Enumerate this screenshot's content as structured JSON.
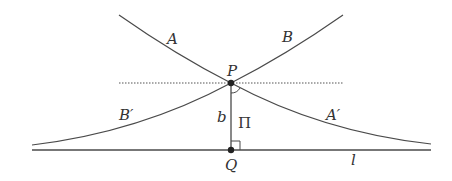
{
  "diagram": {
    "colors": {
      "stroke": "#4a4a4a",
      "text": "#333333",
      "background": "#ffffff"
    },
    "points": {
      "P": {
        "label": "P",
        "x": 231,
        "y": 83
      },
      "Q": {
        "label": "Q",
        "x": 231,
        "y": 150
      }
    },
    "lines": {
      "l": {
        "label": "l",
        "x1": 32,
        "x2": 431,
        "y": 150
      },
      "dotted": {
        "x1": 119,
        "x2": 343,
        "y": 83
      },
      "perpendicular": {
        "label": "b"
      }
    },
    "curves": {
      "A": {
        "label": "A"
      },
      "B": {
        "label": "B"
      },
      "A_prime": {
        "label": "A′"
      },
      "B_prime": {
        "label": "B′"
      }
    },
    "angle": {
      "label": "Π"
    }
  }
}
